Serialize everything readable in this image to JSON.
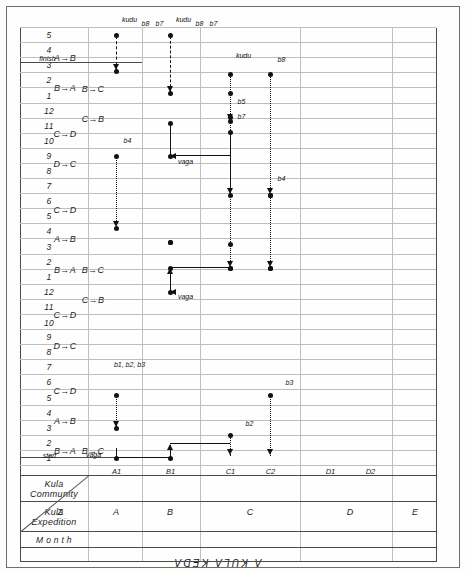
{
  "figure": {
    "title": "A  KULA  KEDA",
    "orientation": "rotated-90",
    "start_label": "start",
    "finish_label": "finish"
  },
  "header": {
    "month_label": "M o n t h",
    "expedition_label_line1": "Kula",
    "expedition_label_line2": "Expedition",
    "community_label_line1": "Kula",
    "community_label_line2": "Community"
  },
  "months": [
    "1",
    "2",
    "3",
    "4",
    "5",
    "6",
    "7",
    "8",
    "9",
    "10",
    "11",
    "12",
    "1",
    "2",
    "3",
    "4",
    "5",
    "6",
    "7",
    "8",
    "9",
    "10",
    "11",
    "12",
    "1",
    "2",
    "3",
    "4",
    "5"
  ],
  "expeditions": [
    {
      "month_index": 0,
      "span": 2,
      "label": "B→A"
    },
    {
      "month_index": 2,
      "span": 2,
      "label": "A→B"
    },
    {
      "month_index": 4,
      "span": 2,
      "label": "C→D"
    },
    {
      "month_index": 7,
      "span": 2,
      "label": "D→C"
    },
    {
      "month_index": 9,
      "span": 2,
      "label": "C→D"
    },
    {
      "month_index": 12,
      "span": 2,
      "label": "B→A"
    },
    {
      "month_index": 14,
      "span": 2,
      "label": "A→B"
    },
    {
      "month_index": 16,
      "span": 2,
      "label": "C→D"
    },
    {
      "month_index": 19,
      "span": 2,
      "label": "D→C"
    },
    {
      "month_index": 21,
      "span": 2,
      "label": "C→D"
    },
    {
      "month_index": 24,
      "span": 2,
      "label": "B→A"
    },
    {
      "month_index": 26,
      "span": 2,
      "label": "A→B"
    }
  ],
  "communities_inner": [
    {
      "month_index": 0,
      "span": 2,
      "label": "B→C"
    },
    {
      "month_index": 10,
      "span": 2,
      "label": "C→B"
    },
    {
      "month_index": 12,
      "span": 2,
      "label": "B→C"
    },
    {
      "month_index": 22,
      "span": 2,
      "label": "C→B"
    },
    {
      "month_index": 24,
      "span": 2,
      "label": "B→C"
    }
  ],
  "community_axis": {
    "groups": [
      "Z",
      "A",
      "B",
      "C",
      "D",
      "E"
    ],
    "stations": [
      "A1",
      "B1",
      "C1",
      "C2",
      "D1",
      "D2"
    ]
  },
  "chart_data": {
    "type": "diagram",
    "title": "A KULA KEDA",
    "xlabel": "Month",
    "ylabel": "Kula Community",
    "valuable_labels": [
      "vaga",
      "b1, b2, b3",
      "b2",
      "b3",
      "b4",
      "b5",
      "b6",
      "b7",
      "b8",
      "kudu"
    ],
    "annotations": [
      {
        "text": "start",
        "month": 1,
        "station": "Z"
      },
      {
        "text": "vaga",
        "month": 1,
        "station": "A1"
      },
      {
        "text": "b2",
        "month": 1,
        "station": "C1"
      },
      {
        "text": "b3",
        "month": 1,
        "station": "C2"
      },
      {
        "text": "b1, b2, b3",
        "month": 3,
        "station": "B1"
      },
      {
        "text": "b5",
        "month": 12,
        "station": "D2"
      },
      {
        "text": "b4",
        "month": 12,
        "station": "C2"
      },
      {
        "text": "vaga",
        "month": 12,
        "station": "B1"
      },
      {
        "text": "b4",
        "month": 14,
        "station": "C1"
      },
      {
        "text": "b8",
        "month": 14,
        "station": "C2"
      },
      {
        "text": "b4",
        "month": 16,
        "station": "B1"
      },
      {
        "text": "b7",
        "month": 18,
        "station": "C1"
      },
      {
        "text": "b8",
        "month": 18,
        "station": "D2"
      },
      {
        "text": "vaga",
        "month": 21,
        "station": "C1"
      },
      {
        "text": "kudu",
        "month": 23,
        "station": "C2"
      },
      {
        "text": "b7",
        "month": 25,
        "station": "B1"
      },
      {
        "text": "b8",
        "month": 25,
        "station": "B1"
      },
      {
        "text": "kudu",
        "month": 25,
        "station": "C2"
      },
      {
        "text": "b7",
        "month": 28,
        "station": "A1"
      },
      {
        "text": "b8",
        "month": 28,
        "station": "A1"
      },
      {
        "text": "kudu",
        "month": 28,
        "station": "B1"
      },
      {
        "text": "finish",
        "month": 28,
        "station": "Z"
      }
    ]
  },
  "colors": {
    "ink": "#111111",
    "grid": "#bfbfbf",
    "frame": "#4a4a4a",
    "paper": "#fefefe"
  }
}
